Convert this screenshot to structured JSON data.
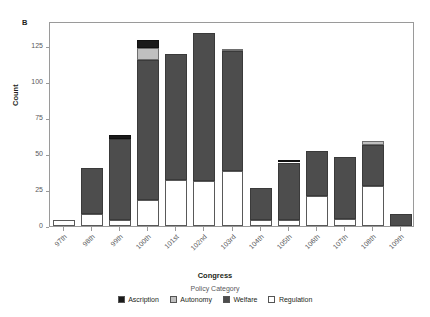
{
  "panel": {
    "label": "B"
  },
  "axes": {
    "y_title": "Count",
    "x_title": "Congress",
    "y_ticks": [
      "0",
      "25",
      "50",
      "75",
      "100",
      "125"
    ]
  },
  "legend": {
    "title": "Policy Category",
    "items": [
      {
        "label": "Ascription",
        "color": "#1a1a1a"
      },
      {
        "label": "Autonomy",
        "color": "#bfbfbf"
      },
      {
        "label": "Welfare",
        "color": "#4d4d4d"
      },
      {
        "label": "Regulation",
        "color": "#ffffff"
      }
    ]
  },
  "chart_data": {
    "type": "bar",
    "title": "",
    "subtitle": "",
    "xlabel": "Congress",
    "ylabel": "Count",
    "ylim": [
      0,
      142
    ],
    "yticks": [
      0,
      25,
      50,
      75,
      100,
      125
    ],
    "grid": false,
    "stacked": true,
    "legend_title": "Policy Category",
    "legend_position": "bottom",
    "categories": [
      "97th",
      "98th",
      "99th",
      "100th",
      "101st",
      "102nd",
      "103rd",
      "104th",
      "105th",
      "106th",
      "107th",
      "108th",
      "109th"
    ],
    "series": [
      {
        "name": "Regulation",
        "color": "#ffffff",
        "values": [
          4,
          8,
          4,
          18,
          32,
          31,
          38,
          4,
          4,
          21,
          5,
          28,
          0
        ]
      },
      {
        "name": "Welfare",
        "color": "#4d4d4d",
        "values": [
          0,
          32,
          56,
          97,
          87,
          103,
          83,
          22,
          40,
          31,
          43,
          28,
          8
        ]
      },
      {
        "name": "Autonomy",
        "color": "#bfbfbf",
        "values": [
          0,
          0,
          0,
          8,
          0,
          0,
          1,
          0,
          0,
          0,
          0,
          3,
          0
        ]
      },
      {
        "name": "Ascription",
        "color": "#1a1a1a",
        "values": [
          0,
          0,
          3,
          6,
          0,
          0,
          0,
          0,
          1,
          0,
          0,
          0,
          0
        ]
      }
    ],
    "totals": [
      4,
      40,
      63,
      129,
      119,
      134,
      122,
      26,
      45,
      52,
      48,
      59,
      8
    ]
  }
}
